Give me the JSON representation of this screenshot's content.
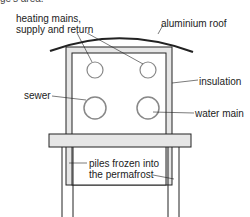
{
  "diagram": {
    "type": "cross-section",
    "top_partial_text": "ge's area.",
    "labels": {
      "heating_mains_line1": "heating mains,",
      "heating_mains_line2": "supply and return",
      "aluminium_roof": "aluminium roof",
      "insulation": "insulation",
      "sewer": "sewer",
      "water_main": "water main",
      "piles_line1": "piles frozen into",
      "piles_line2": "the permafrost"
    },
    "colors": {
      "line": "#222222",
      "insulation_fill": "#e6e6e6",
      "pipe_stroke": "#888888"
    }
  }
}
